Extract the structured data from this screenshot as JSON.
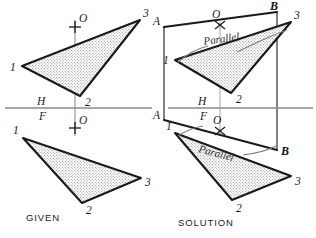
{
  "figure": {
    "title_given": "GIVEN",
    "title_solution": "SOLUTION",
    "parallel_note": "Parallel",
    "colors": {
      "outline": "#1a1a1a",
      "fill": "#d8d8d8",
      "reference_line": "#8a8a8a",
      "projection_line": "#5a5a5a",
      "leader": "#6a6a6a",
      "background": "#ffffff"
    },
    "views": {
      "given_top": {
        "name": "given-top-view",
        "plane": "H",
        "vertices": [
          {
            "label": "1",
            "x": 22,
            "y": 66
          },
          {
            "label": "2",
            "x": 80,
            "y": 96
          },
          {
            "label": "3",
            "x": 140,
            "y": 20
          }
        ],
        "point": {
          "label": "O",
          "x": 75,
          "y": 27
        }
      },
      "given_front": {
        "name": "given-front-view",
        "plane": "F",
        "vertices": [
          {
            "label": "1",
            "x": 23,
            "y": 138
          },
          {
            "label": "2",
            "x": 82,
            "y": 203
          },
          {
            "label": "3",
            "x": 141,
            "y": 178
          }
        ],
        "point": {
          "label": "O",
          "x": 75,
          "y": 128
        }
      },
      "solution_top": {
        "name": "solution-top-view",
        "plane": "H",
        "vertices": [
          {
            "label": "1",
            "x": 175,
            "y": 60
          },
          {
            "label": "2",
            "x": 231,
            "y": 93
          },
          {
            "label": "3",
            "x": 291,
            "y": 22
          }
        ],
        "point": {
          "label": "O",
          "x": 220,
          "y": 25
        },
        "line": {
          "start_label": "A",
          "end_label": "B",
          "ax": 164,
          "ay": 27,
          "bx": 277,
          "by": 12
        }
      },
      "solution_front": {
        "name": "solution-front-view",
        "plane": "F",
        "vertices": [
          {
            "label": "1",
            "x": 175,
            "y": 133
          },
          {
            "label": "2",
            "x": 232,
            "y": 200
          },
          {
            "label": "3",
            "x": 291,
            "y": 176
          }
        ],
        "point": {
          "label": "O",
          "x": 220,
          "y": 131
        },
        "line": {
          "start_label": "A",
          "end_label": "B",
          "ax": 164,
          "ay": 120,
          "bx": 277,
          "by": 150
        }
      }
    },
    "reference_lines": {
      "left": {
        "name": "hf-reference-line-left",
        "label_top": "H",
        "label_bottom": "F",
        "y": 108,
        "x1": 5,
        "x2": 152
      },
      "right": {
        "name": "hf-reference-line-right",
        "label_top": "H",
        "label_bottom": "F",
        "y": 108,
        "x1": 168,
        "x2": 313
      }
    },
    "labels": {
      "h_left": "H",
      "f_left": "F",
      "h_right": "H",
      "f_right": "F",
      "a_top": "A",
      "b_top": "B",
      "a_bottom": "A",
      "b_bottom": "B",
      "o": "O",
      "v1": "1",
      "v2": "2",
      "v3": "3"
    }
  }
}
